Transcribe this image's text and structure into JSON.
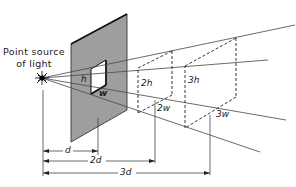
{
  "figure": {
    "source_label_line1": "Point source",
    "source_label_line2": "of light",
    "aperture_labels": {
      "height": "h",
      "width": "w"
    },
    "box2_labels": {
      "height": "2h",
      "width": "2w"
    },
    "box3_labels": {
      "height": "3h",
      "width": "3w"
    },
    "distance_labels": {
      "d1": "d",
      "d2": "2d",
      "d3": "3d"
    },
    "colors": {
      "screen_fill": "#9e9e9e",
      "line": "#333333",
      "background": "#ffffff"
    }
  }
}
